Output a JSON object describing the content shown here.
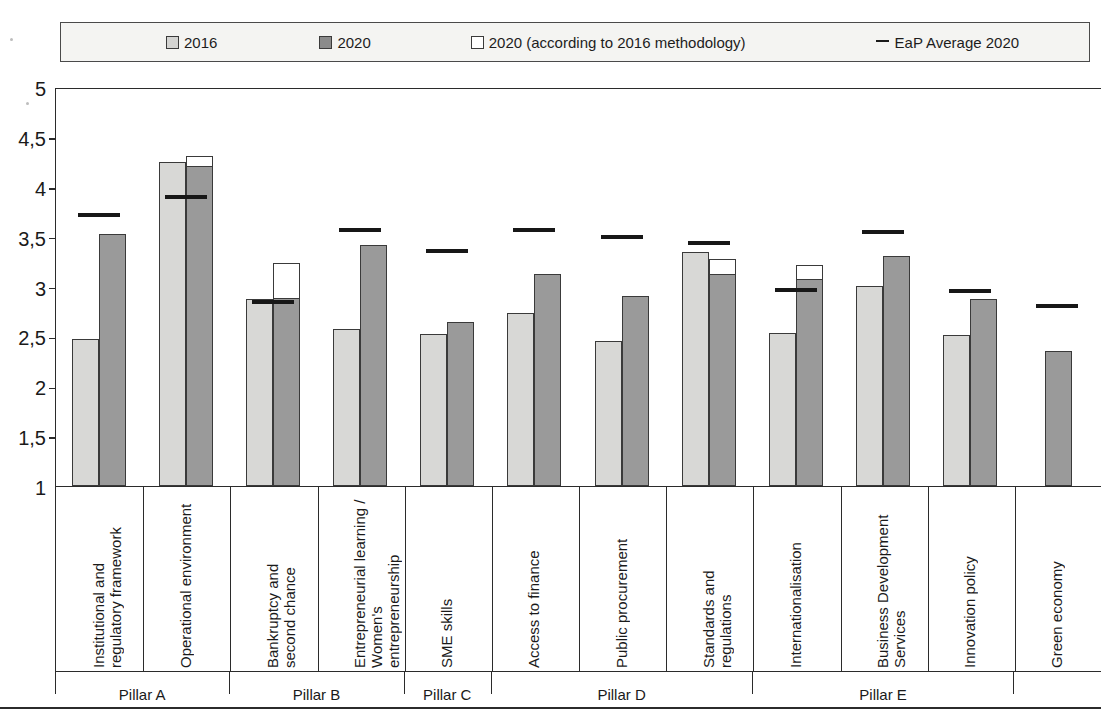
{
  "legend": {
    "items": [
      {
        "label": "2016",
        "marker": "square-light-swatch",
        "color": "#d4d4d2"
      },
      {
        "label": "2020",
        "marker": "square-dark-swatch",
        "color": "#8b8b8b"
      },
      {
        "label": "2020 (according to 2016 methodology)",
        "marker": "square-white-swatch",
        "color": "#ffffff"
      },
      {
        "label": "EaP Average 2020",
        "marker": "dash-line-marker",
        "color": "#1a1a1a"
      }
    ]
  },
  "axis": {
    "y_ticks": [
      "5",
      "4,5",
      "4",
      "3,5",
      "3",
      "2,5",
      "2",
      "1,5",
      "1"
    ],
    "y_min": 1,
    "y_max": 5
  },
  "pillars": [
    {
      "label": "Pillar A",
      "span": 2
    },
    {
      "label": "Pillar B",
      "span": 2
    },
    {
      "label": "Pillar C",
      "span": 1
    },
    {
      "label": "Pillar D",
      "span": 3
    },
    {
      "label": "Pillar E",
      "span": 3
    }
  ],
  "chart_data": {
    "type": "bar",
    "title": "",
    "xlabel": "",
    "ylabel": "",
    "ylim": [
      1,
      5
    ],
    "grid": false,
    "legend_position": "top",
    "categories": [
      "Institutional and\nregulatory framework",
      "Operational environment",
      "Bankruptcy and\nsecond chance",
      "Entrepreneurial learning /\nWomen's entrepreneurship",
      "SME skills",
      "Access to finance",
      "Public procurement",
      "Standards and regulations",
      "Internationalisation",
      "Business Development\nServices",
      "Innovation policy",
      "Green economy"
    ],
    "series": [
      {
        "name": "2016",
        "values": [
          2.47,
          4.25,
          2.87,
          2.57,
          2.52,
          2.73,
          2.45,
          3.35,
          2.53,
          3.01,
          2.51,
          null
        ]
      },
      {
        "name": "2020",
        "values": [
          3.53,
          4.21,
          2.88,
          3.42,
          2.64,
          3.13,
          2.9,
          3.13,
          3.08,
          3.31,
          2.87,
          2.35
        ]
      },
      {
        "name": "2020 (according to 2016 methodology)",
        "values": [
          null,
          4.31,
          3.24,
          null,
          null,
          null,
          null,
          3.28,
          3.22,
          null,
          null,
          null
        ]
      },
      {
        "name": "EaP Average 2020",
        "values": [
          3.74,
          3.92,
          2.86,
          3.59,
          3.38,
          3.59,
          3.52,
          3.46,
          2.98,
          3.57,
          2.97,
          2.82
        ]
      }
    ],
    "pillar_groups": [
      "Pillar A",
      "Pillar B",
      "Pillar C",
      "Pillar D",
      "Pillar E"
    ]
  }
}
